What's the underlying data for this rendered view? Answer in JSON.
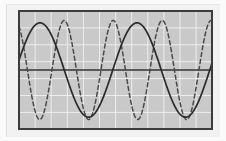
{
  "figure": {
    "kind": "waveform-plot",
    "width": 226,
    "height": 141,
    "background_color": "#fbfbfb",
    "bevel_color": "#f2f2f2",
    "caption": ""
  },
  "plot_area": {
    "x": 19,
    "y": 11,
    "width": 193,
    "height": 118,
    "fill_color": "#c9c9c9",
    "border_color": "#3c3c3c",
    "border_width": 2,
    "grid": {
      "visible": true,
      "color": "#ededed",
      "line_width": 1,
      "x_spacing": 16.1,
      "y_spacing": 16.9,
      "x_count": 12,
      "y_count": 7
    },
    "zero_axis": {
      "visible": true,
      "y": 70,
      "color": "#333333",
      "line_width": 1.4
    }
  },
  "chart_data": {
    "type": "line",
    "title": "",
    "subtitle": "",
    "xlabel": "",
    "ylabel": "",
    "xlim": [
      0,
      193
    ],
    "ylim": [
      -1.25,
      1.25
    ],
    "grid": true,
    "legend": "none",
    "x_tick_labels": [],
    "y_tick_labels": [],
    "annotations": [],
    "series": [
      {
        "name": "solid-wave",
        "style": "solid",
        "color": "#2b2b2b",
        "line_width": 1.7,
        "dash_pattern": "",
        "amplitude": 1.0,
        "period_px": 97,
        "phase_deg": 12,
        "cycles_visible": 2.0,
        "peaks_px": [
          21,
          118
        ],
        "troughs_px": [
          69,
          166
        ]
      },
      {
        "name": "dashed-wave",
        "style": "dashed",
        "color": "#4a4a4a",
        "line_width": 1.5,
        "dash_pattern": "4,3",
        "amplitude": 1.05,
        "period_px": 49,
        "phase_deg": 118,
        "cycles_visible": 3.95,
        "peaks_px": [
          10,
          59,
          108,
          157
        ],
        "troughs_px": [
          34,
          83,
          132,
          181
        ]
      }
    ]
  }
}
